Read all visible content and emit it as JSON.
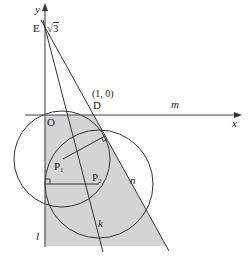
{
  "diagram": {
    "axes": {
      "x_label": "x",
      "y_label": "y",
      "origin_label": "O"
    },
    "points": {
      "E": {
        "label": "E",
        "value_label": "√3"
      },
      "D": {
        "label": "D",
        "coord_label": "(1, 0)"
      },
      "P1": {
        "label": "P₁"
      },
      "P2": {
        "label": "P₂"
      }
    },
    "lines": {
      "m": "m",
      "n": "n",
      "k": "k",
      "l": "l"
    },
    "colors": {
      "shaded_region": "#d4d4d4",
      "stroke": "#333333",
      "background": "#ffffff"
    }
  }
}
